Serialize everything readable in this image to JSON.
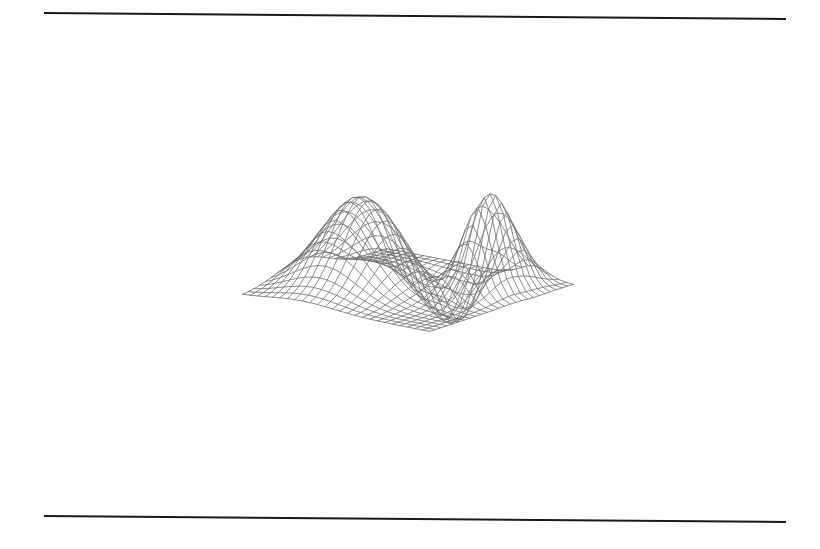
{
  "figure": {
    "kind": "3d-wireframe-surface-plot",
    "caption": "",
    "background_color": "#ffffff",
    "line_color": "#6e6e6e",
    "line_width": 0.8,
    "rules": {
      "color": "#1a1a1a",
      "thickness": 2,
      "top_y": 16,
      "bottom_y": 519,
      "left_x": 44,
      "right_x": 786,
      "tilt_px": 6,
      "count": 2
    },
    "mesh": {
      "rows": 26,
      "cols": 26,
      "u_range": [
        -3,
        3
      ],
      "v_range": [
        -3,
        3
      ]
    },
    "projection": {
      "type": "oblique-axonometric",
      "azimuth_deg": -37.5,
      "elevation_deg": 30,
      "origin_x": 408,
      "origin_y": 268,
      "scale_x": 118,
      "scale_y": 59,
      "scale_z": 96
    },
    "corners": {
      "top": [
        325,
        26
      ],
      "left": [
        48,
        273
      ],
      "bottom": [
        545,
        478
      ],
      "right": [
        765,
        153
      ]
    }
  },
  "chart_data": {
    "type": "surface",
    "title": "",
    "subtitle": "",
    "xlabel": "",
    "ylabel": "",
    "zlabel": "",
    "legend": [],
    "annotations": [],
    "grid": true,
    "axes_visible": false,
    "tick_labels": [],
    "surface_formula": "z = 0.95*exp(-((u+1.1)^2 + (v+0.55)^2)/2.2) + 1.18*exp(-((u-1.75)^2)/0.38 - ((v-1.15)^2)/1.5) - 0.52*exp(-((u-0.15)^2)/2.4 - ((v-1.35)^2)/0.55)",
    "features": [
      {
        "name": "dome",
        "location": "near-left",
        "relative_height": 0.95
      },
      {
        "name": "ridge-peak",
        "location": "far-right",
        "relative_height": 1.18
      },
      {
        "name": "valley-saddle",
        "location": "center-back diagonal",
        "relative_height": -0.52
      }
    ],
    "x": [
      -3,
      -2.76,
      -2.52,
      -2.28,
      -2.04,
      -1.8,
      -1.56,
      -1.32,
      -1.08,
      -0.84,
      -0.6,
      -0.36,
      -0.12,
      0.12,
      0.36,
      0.6,
      0.84,
      1.08,
      1.32,
      1.56,
      1.8,
      2.04,
      2.28,
      2.52,
      2.76,
      3
    ],
    "y": [
      -3,
      -2.76,
      -2.52,
      -2.28,
      -2.04,
      -1.8,
      -1.56,
      -1.32,
      -1.08,
      -0.84,
      -0.6,
      -0.36,
      -0.12,
      0.12,
      0.36,
      0.6,
      0.84,
      1.08,
      1.32,
      1.56,
      1.8,
      2.04,
      2.28,
      2.52,
      2.76,
      3
    ],
    "zlim": [
      -0.55,
      1.2
    ],
    "z_note": "Evaluated from surface_formula on the x/y grid above; the renderer computes the mesh from the same expression rather than storing the full 26x26 z table."
  }
}
